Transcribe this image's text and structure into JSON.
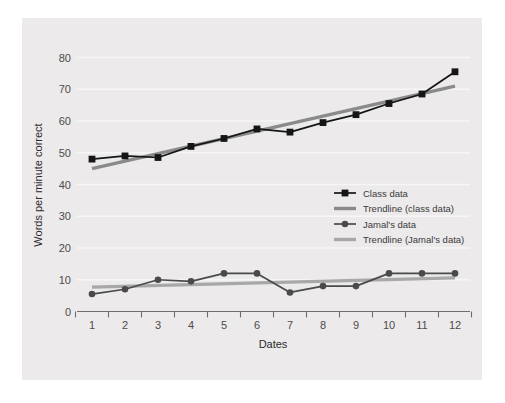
{
  "chart_data": {
    "type": "line",
    "title": "",
    "xlabel": "Dates",
    "ylabel": "Words per minute correct",
    "x": [
      1,
      2,
      3,
      4,
      5,
      6,
      7,
      8,
      9,
      10,
      11,
      12
    ],
    "xticklabels": [
      "1",
      "2",
      "3",
      "4",
      "5",
      "6",
      "7",
      "8",
      "9",
      "10",
      "11",
      "12"
    ],
    "yticklabels": [
      "0",
      "10",
      "20",
      "30",
      "40",
      "50",
      "60",
      "70",
      "80"
    ],
    "yticks": [
      0,
      10,
      20,
      30,
      40,
      50,
      60,
      70,
      80
    ],
    "ylim": [
      0,
      84
    ],
    "xlim": [
      0.5,
      12.5
    ],
    "grid": "horizontal",
    "legend_position": "center-right",
    "series": [
      {
        "name": "Class data",
        "kind": "markers-line",
        "marker": "square",
        "color": "#151515",
        "values": [
          48,
          49,
          48.5,
          52,
          54.5,
          57.5,
          56.5,
          59.5,
          62,
          65.5,
          68.5,
          75.5
        ]
      },
      {
        "name": "Trendline (class data)",
        "kind": "trendline",
        "color": "#8a8a8a",
        "endpoints": [
          45,
          71
        ]
      },
      {
        "name": "Jamal's data",
        "kind": "markers-line",
        "marker": "circle",
        "color": "#4a4a4a",
        "values": [
          5.5,
          7,
          10,
          9.5,
          12,
          12,
          6,
          8,
          8,
          12,
          12,
          12
        ]
      },
      {
        "name": "Trendline (Jamal's data)",
        "kind": "trendline",
        "color": "#a8a8a8",
        "endpoints": [
          7.7,
          10.6
        ]
      }
    ]
  },
  "legend": {
    "entries": [
      {
        "label": "Class data",
        "swatch": "square-marker-line",
        "color": "#151515"
      },
      {
        "label": "Trendline (class data)",
        "swatch": "line",
        "color": "#8a8a8a"
      },
      {
        "label": "Jamal's data",
        "swatch": "circle-marker-line",
        "color": "#4a4a4a"
      },
      {
        "label": "Trendline (Jamal's data)",
        "swatch": "line",
        "color": "#a8a8a8"
      }
    ]
  },
  "colors": {
    "figure_background": "#ffffff",
    "plot_background": "#eceaea",
    "gridline": "#f7f6f6",
    "axis": "#6e6e6e",
    "tick_text": "#4c4c4c"
  }
}
